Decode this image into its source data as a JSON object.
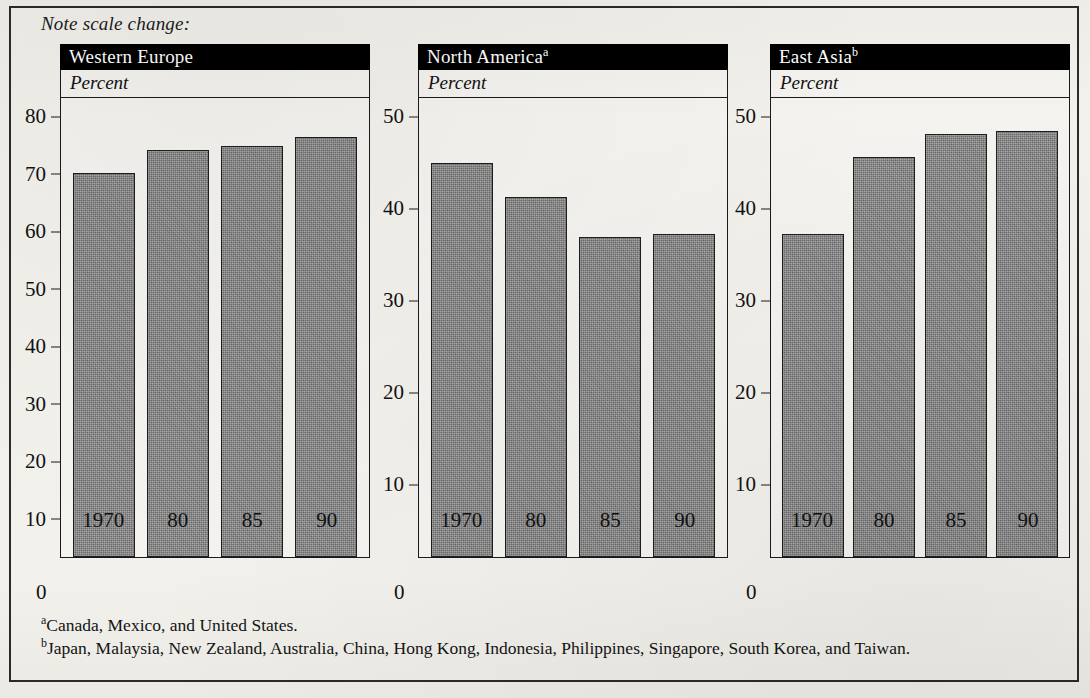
{
  "note": "Note scale change:",
  "subtitle_label": "Percent",
  "zero_label": "0",
  "footnotes": {
    "a_marker": "a",
    "a_text": "Canada, Mexico, and United States.",
    "b_marker": "b",
    "b_text": "Japan, Malaysia, New Zealand, Australia, China, Hong Kong, Indonesia, Philippines, Singapore, South Korea, and Taiwan."
  },
  "colors": {
    "bar_fill": "#6f6f6f",
    "bar_outline": "#1d1d1d",
    "header_background": "#000000",
    "header_text": "#ffffff",
    "page_background": "#f2f1ec"
  },
  "panels": [
    {
      "title": "Western Europe",
      "superscript": "",
      "subtitle": "Percent",
      "yticks": [
        80,
        70,
        60,
        50,
        40,
        30,
        20,
        10
      ],
      "ymax": 80
    },
    {
      "title": "North America",
      "superscript": "a",
      "subtitle": "Percent",
      "yticks": [
        50,
        40,
        30,
        20,
        10
      ],
      "ymax": 50
    },
    {
      "title": "East Asia",
      "superscript": "b",
      "subtitle": "Percent",
      "yticks": [
        50,
        40,
        30,
        20,
        10
      ],
      "ymax": 50
    }
  ],
  "chart_data": {
    "type": "bar",
    "title": "Note scale change:",
    "xlabel": "",
    "ylabel": "Percent",
    "grid": false,
    "legend": "none",
    "categories": [
      "1970",
      "80",
      "85",
      "90"
    ],
    "panels": [
      {
        "name": "Western Europe",
        "ylim": [
          0,
          80
        ],
        "yticks": [
          10,
          20,
          30,
          40,
          50,
          60,
          70,
          80
        ],
        "values": [
          66.8,
          70.8,
          71.5,
          73.0
        ]
      },
      {
        "name": "North America",
        "footnote": "a",
        "ylim": [
          0,
          50
        ],
        "yticks": [
          10,
          20,
          30,
          40,
          50
        ],
        "values": [
          42.8,
          39.1,
          34.8,
          35.1
        ]
      },
      {
        "name": "East Asia",
        "footnote": "b",
        "ylim": [
          0,
          50
        ],
        "yticks": [
          10,
          20,
          30,
          40,
          50
        ],
        "values": [
          35.1,
          43.5,
          46.0,
          46.3
        ]
      }
    ]
  }
}
